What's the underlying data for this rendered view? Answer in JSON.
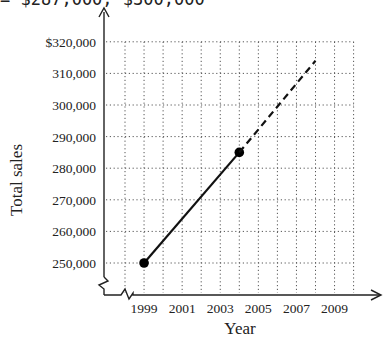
{
  "top_caption": "= $287,000, $300,000",
  "chart_data": {
    "type": "line",
    "title": "",
    "xlabel": "Year",
    "ylabel": "Total sales",
    "x_ticks": [
      "1999",
      "2001",
      "2003",
      "2005",
      "2007",
      "2009"
    ],
    "y_ticks": [
      "$320,000",
      "310,000",
      "300,000",
      "290,000",
      "280,000",
      "270,000",
      "260,000",
      "250,000"
    ],
    "xlim": [
      1998,
      2010
    ],
    "ylim": [
      250000,
      320000
    ],
    "grid": true,
    "axis_breaks": true,
    "series": [
      {
        "name": "Actual",
        "style": "solid",
        "markers": true,
        "x": [
          1999,
          2004
        ],
        "y": [
          250000,
          285000
        ]
      },
      {
        "name": "Projected",
        "style": "dashed",
        "markers": false,
        "x": [
          2004,
          2008
        ],
        "y": [
          285000,
          314000
        ]
      }
    ]
  }
}
